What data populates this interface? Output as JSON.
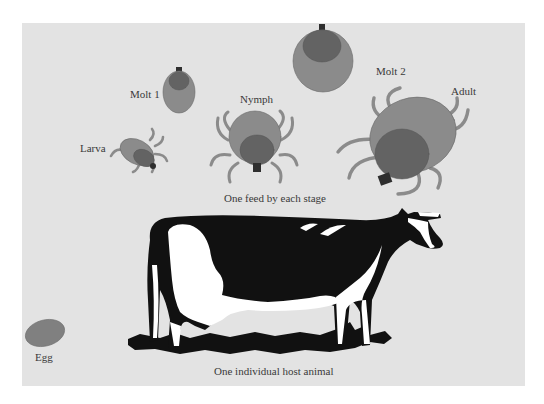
{
  "figure": {
    "background_color": "#e3e3e3",
    "colors": {
      "tick_body": "#8b8b8b",
      "tick_scutum": "#636363",
      "tick_mouthparts": "#2e2e2e",
      "tick_legs": "#8b8b8b",
      "egg": "#808080",
      "cow_black": "#111111",
      "cow_white": "#ffffff",
      "label_text": "#3a3a3a"
    }
  },
  "stages": {
    "larva": {
      "label": "Larva"
    },
    "molt1": {
      "label": "Molt 1"
    },
    "nymph": {
      "label": "Nymph"
    },
    "molt2": {
      "label": "Molt 2"
    },
    "adult": {
      "label": "Adult"
    },
    "egg": {
      "label": "Egg"
    }
  },
  "captions": {
    "feeding": "One feed by each stage",
    "host": "One individual host animal"
  },
  "host": {
    "animal": "cow-icon"
  }
}
